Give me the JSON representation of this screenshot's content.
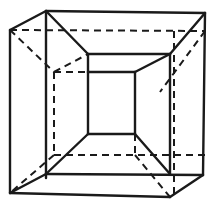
{
  "figure": {
    "title": "",
    "colors": {
      "line": "#1a1a1a",
      "background": "#ffffff"
    },
    "solid_edges": [
      [
        10,
        30,
        46,
        11
      ],
      [
        46,
        11,
        205,
        13
      ],
      [
        205,
        13,
        203,
        175
      ],
      [
        10,
        30,
        10,
        193
      ],
      [
        10,
        193,
        170,
        197
      ],
      [
        170,
        197,
        203,
        175
      ],
      [
        46,
        11,
        46,
        178
      ],
      [
        46,
        11,
        88,
        54
      ],
      [
        88,
        54,
        170,
        54
      ],
      [
        170,
        54,
        205,
        13
      ],
      [
        170,
        54,
        170,
        174
      ],
      [
        46,
        174,
        203,
        175
      ],
      [
        10,
        193,
        46,
        174
      ],
      [
        88,
        72,
        135,
        72
      ],
      [
        88,
        72,
        88,
        134
      ],
      [
        135,
        72,
        135,
        134
      ],
      [
        88,
        134,
        135,
        134
      ],
      [
        88,
        54,
        88,
        72
      ],
      [
        135,
        72,
        170,
        54
      ],
      [
        88,
        134,
        46,
        174
      ],
      [
        135,
        134,
        170,
        174
      ]
    ],
    "dashed_edges": [
      [
        10,
        30,
        205,
        31
      ],
      [
        10,
        30,
        54,
        72
      ],
      [
        54,
        72,
        88,
        72
      ],
      [
        54,
        72,
        54,
        155
      ],
      [
        54,
        155,
        205,
        155
      ],
      [
        205,
        31,
        160,
        92
      ],
      [
        174,
        31,
        174,
        196
      ],
      [
        54,
        155,
        10,
        193
      ],
      [
        135,
        155,
        170,
        197
      ],
      [
        135,
        134,
        135,
        155
      ],
      [
        54,
        72,
        88,
        54
      ]
    ]
  }
}
